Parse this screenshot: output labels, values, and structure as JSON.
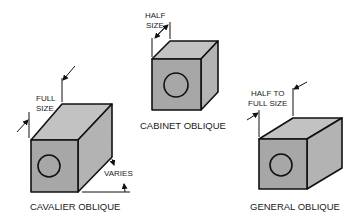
{
  "diagram": {
    "colors": {
      "front_face": "#a7a7a7",
      "top_face": "#c2c2c2",
      "side_face": "#b3b3b3",
      "stroke": "#111111"
    },
    "figures": [
      {
        "id": "cavalier",
        "caption": "CAVALIER OBLIQUE",
        "dimension_label_line1": "FULL",
        "dimension_label_line2": "SIZE",
        "angle_label": "VARIES"
      },
      {
        "id": "cabinet",
        "caption": "CABINET OBLIQUE",
        "dimension_label_line1": "HALF",
        "dimension_label_line2": "SIZE"
      },
      {
        "id": "general",
        "caption": "GENERAL OBLIQUE",
        "dimension_label_line1": "HALF TO",
        "dimension_label_line2": "FULL SIZE"
      }
    ]
  }
}
